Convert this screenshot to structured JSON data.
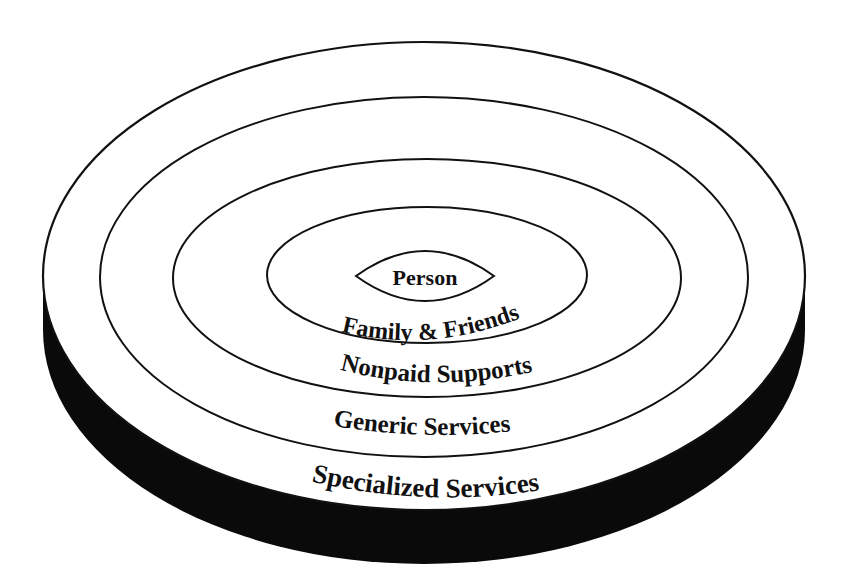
{
  "diagram": {
    "type": "concentric-ellipses",
    "colors": {
      "background": "#ffffff",
      "stroke": "#111111",
      "base": "#0a0a0a",
      "text": "#111111"
    },
    "layers": [
      {
        "label": "Person",
        "order": 1
      },
      {
        "label": "Family & Friends",
        "order": 2
      },
      {
        "label": "Nonpaid Supports",
        "order": 3
      },
      {
        "label": "Generic Services",
        "order": 4
      },
      {
        "label": "Specialized Services",
        "order": 5
      }
    ]
  }
}
